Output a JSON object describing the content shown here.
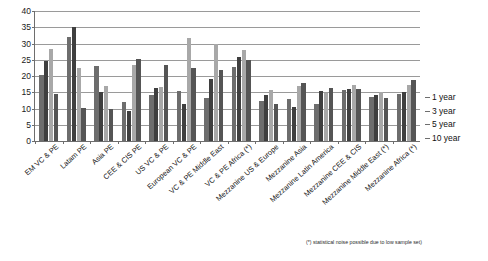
{
  "chart_data": {
    "type": "bar",
    "title": "",
    "xlabel": "",
    "ylabel": "",
    "ylim": [
      0,
      40
    ],
    "yticks": [
      0,
      5,
      10,
      15,
      20,
      25,
      30,
      35,
      40
    ],
    "grid": true,
    "legend_position": "right",
    "categories": [
      "EM VC & PE",
      "Latam PE",
      "Asia PE",
      "CEE & CIS PE",
      "US VC & PE",
      "European VC & PE",
      "VC & PE Middle East",
      "VC & PE Africa (*)",
      "Mezzanine US & Europe",
      "Mezzanine Asia",
      "Mezzanine Latin America",
      "Mezzanine CEE & CIS",
      "Mezzanine Middle East (*)",
      "Mezzanine Africa (*)"
    ],
    "series": [
      {
        "name": "1 year",
        "values": [
          20.4,
          32.0,
          23.0,
          12.1,
          14.2,
          15.4,
          13.2,
          22.8,
          12.2,
          12.8,
          11.3,
          15.6,
          13.5,
          14.4
        ]
      },
      {
        "name": "3 year",
        "values": [
          24.5,
          35.0,
          15.1,
          9.1,
          16.4,
          11.4,
          19.0,
          26.0,
          14.3,
          10.5,
          15.4,
          16.1,
          14.2,
          15.2
        ]
      },
      {
        "name": "5 year",
        "values": [
          28.4,
          22.4,
          17.0,
          23.5,
          16.7,
          31.6,
          30.0,
          27.9,
          15.7,
          17.0,
          14.8,
          17.3,
          15.0,
          17.3
        ]
      },
      {
        "name": "10 year",
        "values": [
          14.6,
          10.3,
          9.8,
          25.1,
          23.3,
          22.4,
          21.9,
          24.9,
          11.5,
          17.8,
          16.4,
          16.1,
          13.1,
          18.9
        ]
      }
    ],
    "legend": [
      "1 year",
      "3 year",
      "5 year",
      "10 year"
    ],
    "footnote": "(*) statistical noise possible due to low sample set)"
  }
}
